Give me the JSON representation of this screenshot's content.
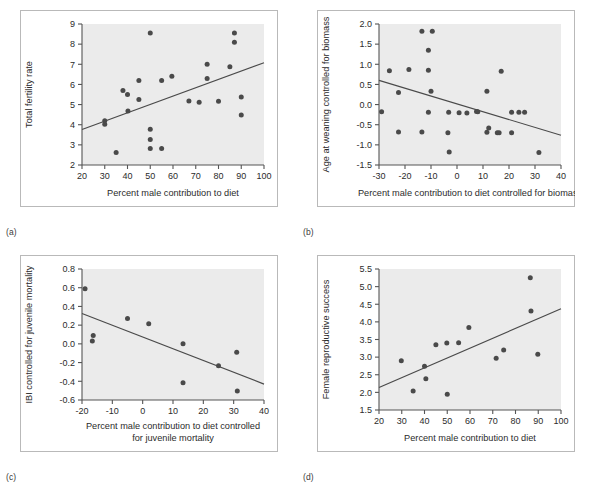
{
  "figure": {
    "background_color": "#ffffff",
    "plot_area_color": "#ebebeb",
    "point_color": "#4a4a4a",
    "line_color": "#4a4a4a",
    "axis_color": "#555555",
    "frame_color": "#b9b9b9"
  },
  "panels": [
    {
      "tag": "(a)",
      "chart_data": {
        "type": "scatter",
        "title": "",
        "xlabel": "Percent male contribution to diet",
        "ylabel": "Total fertility rate",
        "xlim": [
          20,
          100
        ],
        "ylim": [
          2,
          9
        ],
        "xticks": [
          20,
          30,
          40,
          50,
          60,
          70,
          80,
          90,
          100
        ],
        "yticks": [
          2,
          3,
          4,
          5,
          6,
          7,
          8,
          9
        ],
        "xticklabels": [
          "20",
          "30",
          "40",
          "50",
          "60",
          "70",
          "80",
          "90",
          "100"
        ],
        "yticklabels": [
          "2",
          "3",
          "4",
          "5",
          "6",
          "7",
          "8",
          "9"
        ],
        "grid": false,
        "legend": "none",
        "points": [
          [
            30.0,
            4.2
          ],
          [
            30.0,
            4.02
          ],
          [
            35.0,
            2.62
          ],
          [
            38.0,
            5.7
          ],
          [
            40.0,
            5.5
          ],
          [
            40.2,
            4.68
          ],
          [
            45.0,
            6.2
          ],
          [
            45.0,
            5.25
          ],
          [
            50.0,
            8.55
          ],
          [
            50.0,
            3.78
          ],
          [
            50.0,
            3.27
          ],
          [
            50.0,
            2.82
          ],
          [
            55.0,
            6.2
          ],
          [
            55.0,
            2.82
          ],
          [
            59.5,
            6.4
          ],
          [
            67.0,
            5.18
          ],
          [
            71.5,
            5.12
          ],
          [
            75.0,
            7.0
          ],
          [
            75.0,
            6.3
          ],
          [
            80.0,
            5.16
          ],
          [
            85.0,
            6.88
          ],
          [
            87.0,
            8.55
          ],
          [
            87.0,
            8.1
          ],
          [
            90.0,
            5.38
          ],
          [
            90.0,
            4.48
          ]
        ],
        "trendline": {
          "x": [
            20,
            100
          ],
          "y": [
            3.76,
            7.08
          ]
        }
      }
    },
    {
      "tag": "(b)",
      "chart_data": {
        "type": "scatter",
        "title": "",
        "xlabel": "Percent male contribution to diet controlled for biomass",
        "ylabel": "Age at weaning controlled for biomass",
        "xlim": [
          -30,
          40
        ],
        "ylim": [
          -1.5,
          2.0
        ],
        "xticks": [
          -30,
          -20,
          -10,
          0,
          10,
          20,
          30,
          40
        ],
        "yticks": [
          -1.5,
          -1.0,
          -0.5,
          0.0,
          0.5,
          1.0,
          1.5,
          2.0
        ],
        "xticklabels": [
          "-30",
          "-20",
          "-10",
          "0",
          "10",
          "20",
          "30",
          "40"
        ],
        "yticklabels": [
          "-1.5",
          "-1.0",
          "-0.5",
          "0.0",
          "0.5",
          "1.0",
          "1.5",
          "2.0"
        ],
        "grid": false,
        "legend": "none",
        "points": [
          [
            -29.0,
            -0.18
          ],
          [
            -26.0,
            0.84
          ],
          [
            -22.5,
            0.3
          ],
          [
            -22.5,
            -0.68
          ],
          [
            -18.5,
            0.87
          ],
          [
            -13.5,
            1.82
          ],
          [
            -13.5,
            -0.68
          ],
          [
            -11.0,
            1.35
          ],
          [
            -11.0,
            0.85
          ],
          [
            -11.0,
            -0.19
          ],
          [
            -9.5,
            1.82
          ],
          [
            -10.0,
            0.33
          ],
          [
            -3.5,
            -0.7
          ],
          [
            -3.0,
            -1.18
          ],
          [
            -3.2,
            -0.19
          ],
          [
            0.8,
            -0.2
          ],
          [
            3.8,
            -0.21
          ],
          [
            7.5,
            -0.17
          ],
          [
            8.0,
            -0.18
          ],
          [
            11.5,
            0.33
          ],
          [
            11.5,
            -0.69
          ],
          [
            12.2,
            -0.58
          ],
          [
            15.5,
            -0.7
          ],
          [
            16.2,
            -0.7
          ],
          [
            17.0,
            0.83
          ],
          [
            21.0,
            -0.19
          ],
          [
            21.0,
            -0.7
          ],
          [
            23.8,
            -0.19
          ],
          [
            26.0,
            -0.19
          ],
          [
            31.5,
            -1.19
          ]
        ],
        "trendline": {
          "x": [
            -30,
            40
          ],
          "y": [
            0.6,
            -0.76
          ]
        }
      }
    },
    {
      "tag": "(c)",
      "chart_data": {
        "type": "scatter",
        "title": "",
        "xlabel": "Percent male contribution to diet controlled for juvenile mortality",
        "xlabel_lines": [
          "Percent male contribution to diet controlled",
          "for juvenile mortality"
        ],
        "ylabel": "IBI controlled for juvenile mortality",
        "xlim": [
          -20,
          40
        ],
        "ylim": [
          -0.6,
          0.8
        ],
        "xticks": [
          -20,
          -10,
          0,
          10,
          20,
          30,
          40
        ],
        "yticks": [
          -0.6,
          -0.4,
          -0.2,
          0.0,
          0.2,
          0.4,
          0.6,
          0.8
        ],
        "xticklabels": [
          "-20",
          "-10",
          "0",
          "10",
          "20",
          "30",
          "40"
        ],
        "yticklabels": [
          "-0.6",
          "-0.4",
          "-0.2",
          "0.0",
          "0.2",
          "0.4",
          "0.6",
          "0.8"
        ],
        "grid": false,
        "legend": "none",
        "points": [
          [
            -19.0,
            0.59
          ],
          [
            -16.3,
            0.09
          ],
          [
            -16.6,
            0.03
          ],
          [
            -5.0,
            0.27
          ],
          [
            2.0,
            0.215
          ],
          [
            13.3,
            0.0
          ],
          [
            13.3,
            -0.415
          ],
          [
            25.0,
            -0.235
          ],
          [
            31.0,
            -0.09
          ],
          [
            31.2,
            -0.505
          ]
        ],
        "trendline": {
          "x": [
            -20,
            40
          ],
          "y": [
            0.325,
            -0.43
          ]
        }
      }
    },
    {
      "tag": "(d)",
      "chart_data": {
        "type": "scatter",
        "title": "",
        "xlabel": "Percent male contribution to diet",
        "ylabel": "Female reproductive success",
        "xlim": [
          20,
          100
        ],
        "ylim": [
          1.5,
          5.5
        ],
        "xticks": [
          20,
          30,
          40,
          50,
          60,
          70,
          80,
          90,
          100
        ],
        "yticks": [
          1.5,
          2.0,
          2.5,
          3.0,
          3.5,
          4.0,
          4.5,
          5.0,
          5.5
        ],
        "xticklabels": [
          "20",
          "30",
          "40",
          "50",
          "60",
          "70",
          "80",
          "90",
          "100"
        ],
        "yticklabels": [
          "1.5",
          "2.0",
          "2.5",
          "3.0",
          "3.5",
          "4.0",
          "4.5",
          "5.0",
          "5.5"
        ],
        "grid": false,
        "legend": "none",
        "points": [
          [
            29.8,
            2.9
          ],
          [
            35.0,
            2.04
          ],
          [
            40.0,
            2.74
          ],
          [
            40.6,
            2.39
          ],
          [
            45.0,
            3.35
          ],
          [
            49.8,
            3.4
          ],
          [
            50.0,
            1.95
          ],
          [
            55.0,
            3.41
          ],
          [
            59.5,
            3.84
          ],
          [
            71.5,
            2.97
          ],
          [
            74.8,
            3.2
          ],
          [
            86.5,
            5.25
          ],
          [
            86.8,
            4.31
          ],
          [
            89.8,
            3.08
          ]
        ],
        "trendline": {
          "x": [
            20,
            100
          ],
          "y": [
            2.14,
            4.37
          ]
        }
      }
    }
  ]
}
